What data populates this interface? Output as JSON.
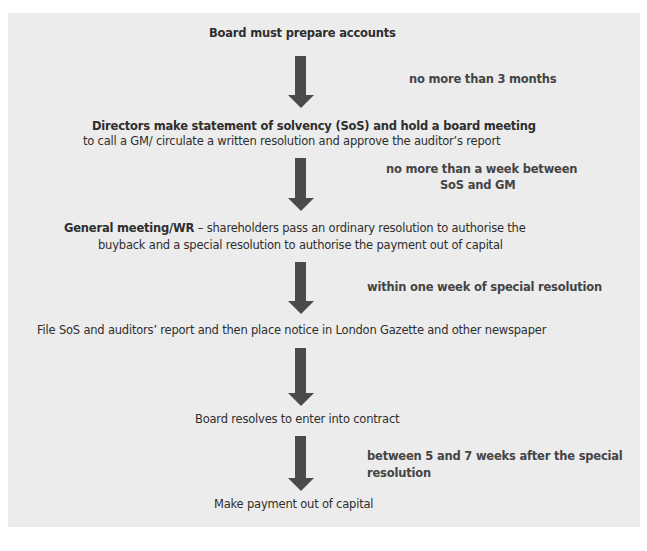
{
  "diagram": {
    "type": "flowchart",
    "colors": {
      "background": "#ececec",
      "arrow": "#4a4a4a",
      "text": "#2e2e2e"
    },
    "steps": [
      {
        "id": "step1",
        "bold": "Board must prepare accounts",
        "text": ""
      },
      {
        "id": "step2",
        "bold": "Directors make statement of solvency (SoS) and hold a board meeting",
        "text": "to call a GM/ circulate a written resolution and approve the auditor’s report"
      },
      {
        "id": "step3",
        "bold": "General meeting/WR",
        "text": " – shareholders pass an ordinary resolution to authorise the",
        "text2": "buyback and a special resolution to authorise the payment out of capital"
      },
      {
        "id": "step4",
        "bold": "",
        "text": "File SoS and auditors’ report and then place notice in London Gazette and other newspaper"
      },
      {
        "id": "step5",
        "bold": "",
        "text": "Board resolves to enter into contract"
      },
      {
        "id": "step6",
        "bold": "",
        "text": "Make payment out of capital"
      }
    ],
    "arrows": [
      {
        "from": "step1",
        "to": "step2",
        "label": "no more than 3 months"
      },
      {
        "from": "step2",
        "to": "step3",
        "label_line1": "no more than a week between",
        "label_line2": "SoS and GM"
      },
      {
        "from": "step3",
        "to": "step4",
        "label": "within one week of special resolution"
      },
      {
        "from": "step4",
        "to": "step5",
        "label": ""
      },
      {
        "from": "step5",
        "to": "step6",
        "label_line1": "between 5 and 7 weeks after the special",
        "label_line2": "resolution"
      }
    ]
  }
}
